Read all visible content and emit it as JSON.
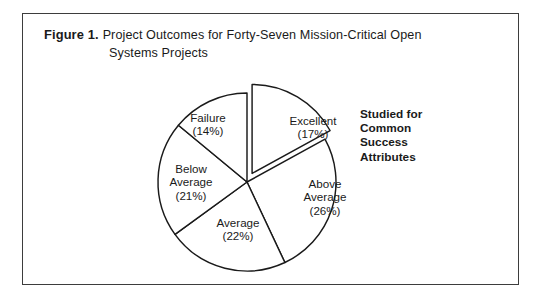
{
  "figure": {
    "label": "Figure 1.",
    "title_line1": "Project Outcomes for Forty-Seven Mission-Critical Open",
    "title_line2": "Systems Projects"
  },
  "annotation": {
    "line1": "Studied for",
    "line2": "Common",
    "line3": "Success",
    "line4": "Attributes"
  },
  "labels": {
    "failure": {
      "name": "Failure",
      "pct": "(14%)"
    },
    "excellent": {
      "name": "Excellent",
      "pct": "(17%)"
    },
    "below_average_l1": "Below",
    "below_average_l2": "Average",
    "below_average_pct": "(21%)",
    "above_average_l1": "Above",
    "above_average_l2": "Average",
    "above_average_pct": "(26%)",
    "average": {
      "name": "Average",
      "pct": "(22%)"
    }
  },
  "colors": {
    "stroke": "#1a1a1a",
    "fill": "#ffffff",
    "frame": "#3d3d3d"
  },
  "chart_data": {
    "type": "pie",
    "title": "Project Outcomes for Forty-Seven Mission-Critical Open Systems Projects",
    "categories": [
      "Excellent",
      "Above Average",
      "Average",
      "Below Average",
      "Failure"
    ],
    "values": [
      17,
      26,
      22,
      21,
      14
    ],
    "unit": "percent",
    "total_projects": 47,
    "exploded_slice": "Excellent",
    "start_angle_deg": -90,
    "direction": "clockwise",
    "legend": "none",
    "data_labels": [
      "Excellent (17%)",
      "Above Average (26%)",
      "Average (22%)",
      "Below Average (21%)",
      "Failure (14%)"
    ],
    "annotation": "Studied for Common Success Attributes",
    "annotation_target": "Excellent",
    "grid": false,
    "xlabel": "",
    "ylabel": ""
  }
}
